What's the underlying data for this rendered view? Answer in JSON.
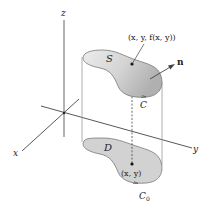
{
  "figure": {
    "axes": {
      "x_label": "x",
      "y_label": "y",
      "z_label": "z"
    },
    "surface": {
      "label": "S",
      "point_label": "(x, y, f(x, y))",
      "normal_label": "n",
      "boundary_label": "C"
    },
    "region": {
      "label": "D",
      "point_label": "(x, y)",
      "boundary_label": "C",
      "boundary_subscript": "0"
    },
    "colors": {
      "surface_fill_light": "#e6e6e6",
      "surface_fill_dark": "#b8b8b8",
      "region_fill": "#d2d2d2",
      "outline": "#777777",
      "axis": "#444444",
      "text": "#222222"
    }
  }
}
